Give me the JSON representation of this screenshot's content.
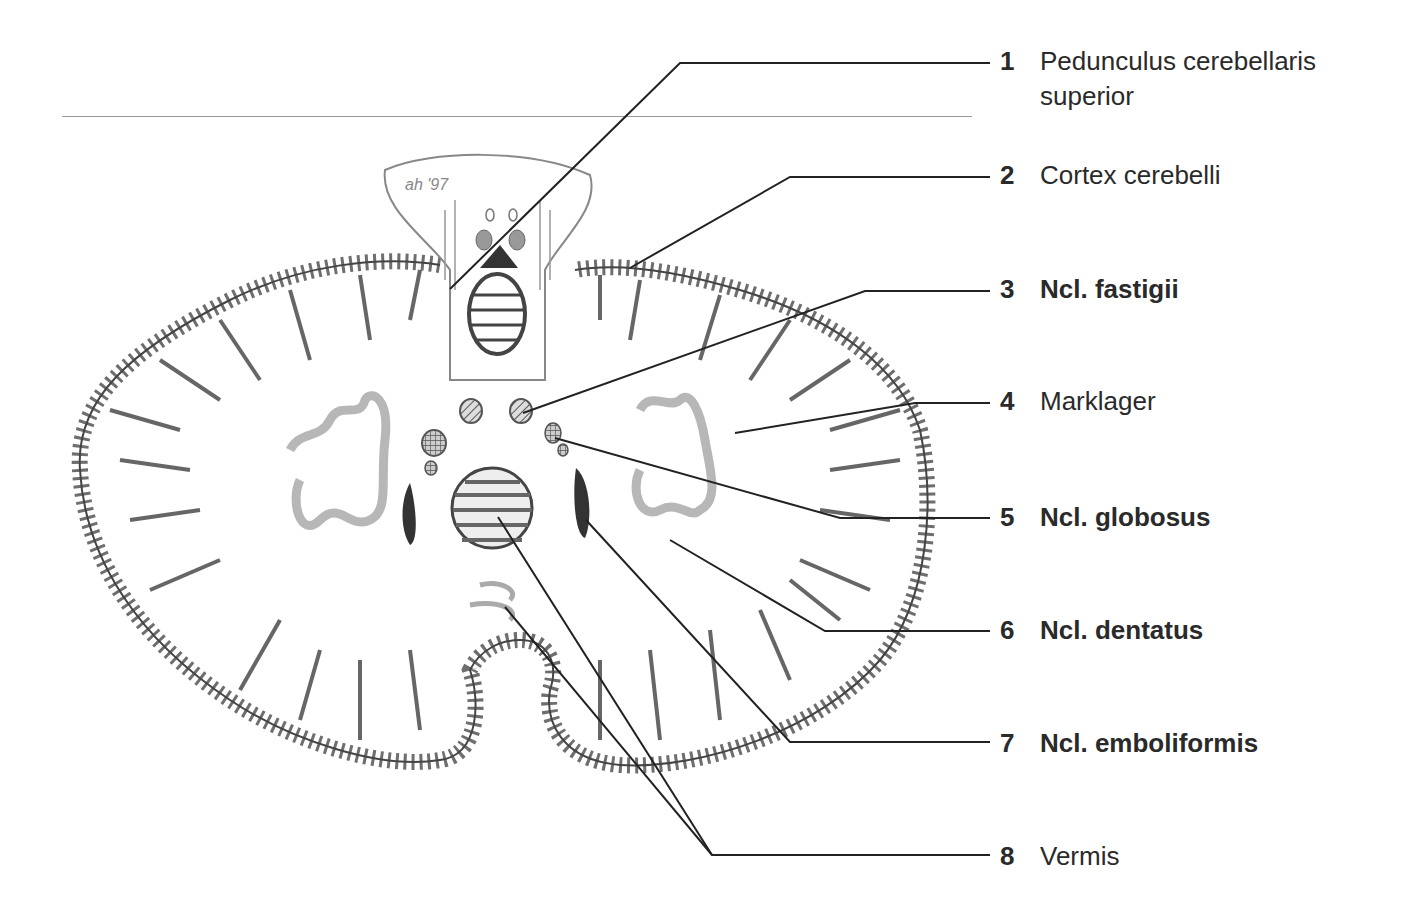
{
  "figure": {
    "signature": "ah '97",
    "labels": [
      {
        "number": "1",
        "text": "Pedunculus cerebellaris superior",
        "line1": "Pedunculus cerebellaris",
        "line2": "superior",
        "bold": false
      },
      {
        "number": "2",
        "text": "Cortex cerebelli",
        "bold": false
      },
      {
        "number": "3",
        "text": "Ncl. fastigii",
        "bold": true
      },
      {
        "number": "4",
        "text": "Marklager",
        "bold": false
      },
      {
        "number": "5",
        "text": "Ncl. globosus",
        "bold": true
      },
      {
        "number": "6",
        "text": "Ncl. dentatus",
        "bold": true
      },
      {
        "number": "7",
        "text": "Ncl. emboliformis",
        "bold": true
      },
      {
        "number": "8",
        "text": "Vermis",
        "bold": false
      }
    ]
  }
}
